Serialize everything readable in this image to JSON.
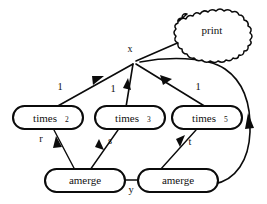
{
  "diagram": {
    "background_color": "#ffffff",
    "stroke_color": "#0b0b0b",
    "nodes": [
      {
        "id": "print",
        "label": "print",
        "subscript": "",
        "shape": "cloud",
        "x": 212,
        "y": 30
      },
      {
        "id": "times2",
        "label": "times",
        "subscript": "2",
        "shape": "stadium",
        "x": 48,
        "y": 118
      },
      {
        "id": "times3",
        "label": "times",
        "subscript": "3",
        "shape": "stadium",
        "x": 130,
        "y": 118
      },
      {
        "id": "times5",
        "label": "times",
        "subscript": "5",
        "shape": "stadium",
        "x": 207,
        "y": 118
      },
      {
        "id": "amergeL",
        "label": "amerge",
        "subscript": "",
        "shape": "stadium",
        "x": 85,
        "y": 180
      },
      {
        "id": "amergeR",
        "label": "amerge",
        "subscript": "",
        "shape": "stadium",
        "x": 178,
        "y": 180
      }
    ],
    "fanout_point": {
      "label": "x",
      "x": 134,
      "y": 62
    },
    "edge_labels": [
      {
        "id": "edge-label-one-left",
        "text": "1",
        "x": 60,
        "y": 88
      },
      {
        "id": "edge-label-one-middle",
        "text": "1",
        "x": 115,
        "y": 90
      },
      {
        "id": "edge-label-one-right",
        "text": "1",
        "x": 198,
        "y": 88
      },
      {
        "id": "edge-label-r",
        "text": "r",
        "x": 41,
        "y": 140
      },
      {
        "id": "edge-label-s",
        "text": "s",
        "x": 109,
        "y": 142
      },
      {
        "id": "edge-label-t",
        "text": "t",
        "x": 189,
        "y": 143
      },
      {
        "id": "edge-label-y",
        "text": "y",
        "x": 131,
        "y": 190
      }
    ],
    "edges": [
      {
        "id": "edge-x-to-print",
        "from": "x",
        "to": "print",
        "label": ""
      },
      {
        "id": "edge-x-to-times2",
        "from": "x",
        "to": "times2",
        "label": "1"
      },
      {
        "id": "edge-x-to-times3",
        "from": "x",
        "to": "times3",
        "label": "1"
      },
      {
        "id": "edge-x-to-times5",
        "from": "x",
        "to": "times5",
        "label": "1"
      },
      {
        "id": "edge-times2-amergeL",
        "from": "times2",
        "to": "amergeL",
        "label": "r"
      },
      {
        "id": "edge-times3-amergeL",
        "from": "times3",
        "to": "amergeL",
        "label": "s"
      },
      {
        "id": "edge-amergeR-times5",
        "from": "amergeR",
        "to": "times5",
        "label": "t"
      },
      {
        "id": "edge-amergeL-amergeR",
        "from": "amergeL",
        "to": "amergeR",
        "label": "y"
      },
      {
        "id": "edge-amergeR-x",
        "from": "amergeR",
        "to": "x",
        "label": ""
      }
    ]
  }
}
